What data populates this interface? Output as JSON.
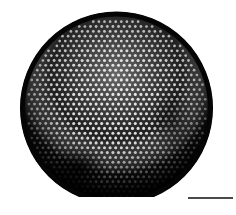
{
  "image": {
    "subject": "diatom valve micrograph",
    "description": "Circular diatom frustule with hexagonal areolae pattern, bottom edge flat-cut",
    "background": "#ffffff",
    "specimen": {
      "shape": "circle",
      "center_x": 116.5,
      "center_y": 108,
      "radius": 96,
      "clip_bottom_y": 197,
      "rim_color": "#050505",
      "base_color": "#141414",
      "pore_color": "#e8e8e8",
      "pore_spacing": 5.6,
      "pore_radius": 1.35
    },
    "scale_bar": {
      "x": 188,
      "y": 197,
      "width": 45,
      "color": "#4a4a4a",
      "label": ""
    }
  }
}
